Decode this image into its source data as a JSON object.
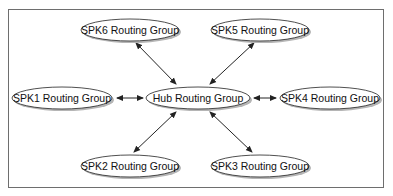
{
  "diagram": {
    "type": "hub-and-spoke",
    "nodes": [
      {
        "id": "spk6",
        "label": "SPK6 Routing Group",
        "cx": 130,
        "cy": 30,
        "rx": 49,
        "ry": 11
      },
      {
        "id": "spk5",
        "label": "SPK5 Routing Group",
        "cx": 260,
        "cy": 30,
        "rx": 49,
        "ry": 11
      },
      {
        "id": "spk1",
        "label": "SPK1 Routing Group",
        "cx": 62,
        "cy": 98,
        "rx": 50,
        "ry": 11
      },
      {
        "id": "hub",
        "label": "Hub Routing Group",
        "cx": 198,
        "cy": 98,
        "rx": 52,
        "ry": 11
      },
      {
        "id": "spk4",
        "label": "SPK4 Routing Group",
        "cx": 330,
        "cy": 98,
        "rx": 50,
        "ry": 11
      },
      {
        "id": "spk2",
        "label": "SPK2 Routing Group",
        "cx": 130,
        "cy": 166,
        "rx": 49,
        "ry": 11
      },
      {
        "id": "spk3",
        "label": "SPK3 Routing Group",
        "cx": 260,
        "cy": 166,
        "rx": 49,
        "ry": 11
      }
    ],
    "edges": [
      {
        "from": "hub",
        "to": "spk6",
        "bidirectional": true
      },
      {
        "from": "hub",
        "to": "spk5",
        "bidirectional": true
      },
      {
        "from": "hub",
        "to": "spk1",
        "bidirectional": true
      },
      {
        "from": "hub",
        "to": "spk4",
        "bidirectional": true
      },
      {
        "from": "hub",
        "to": "spk2",
        "bidirectional": true
      },
      {
        "from": "hub",
        "to": "spk3",
        "bidirectional": true
      }
    ],
    "colors": {
      "frame": "#6e6e6e",
      "stroke": "#222222",
      "shadow": "#b5b5b5",
      "fill": "#ffffff"
    }
  }
}
